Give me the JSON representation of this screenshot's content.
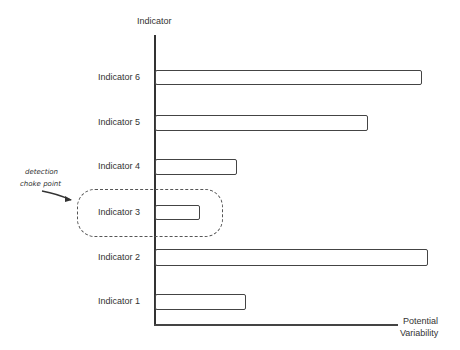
{
  "chart_data": {
    "type": "bar",
    "orientation": "horizontal",
    "style": "hand-drawn sketch",
    "title": "",
    "ylabel": "Indicator",
    "xlabel": "Potential Variability",
    "categories": [
      "Indicator 6",
      "Indicator 5",
      "Indicator 4",
      "Indicator 3",
      "Indicator 2",
      "Indicator 1"
    ],
    "values": [
      267,
      213,
      82,
      45,
      273,
      91
    ],
    "grid": false,
    "legend": null,
    "annotations": [
      {
        "text": "detection choke point",
        "target": "Indicator 3",
        "shape": "dashed rounded rectangle with arrow"
      }
    ]
  },
  "axis": {
    "y_title": "Indicator",
    "x_title_line1": "Potential",
    "x_title_line2": "Variability"
  },
  "annotation": {
    "line1": "detection",
    "line2": "choke point"
  },
  "bars": [
    {
      "label": "Indicator 6",
      "top": 70,
      "height": 15,
      "width": 267
    },
    {
      "label": "Indicator 5",
      "top": 115,
      "height": 16,
      "width": 213
    },
    {
      "label": "Indicator 4",
      "top": 159,
      "height": 16,
      "width": 82
    },
    {
      "label": "Indicator 3",
      "top": 205,
      "height": 15,
      "width": 45
    },
    {
      "label": "Indicator 2",
      "top": 249,
      "height": 17,
      "width": 273
    },
    {
      "label": "Indicator 1",
      "top": 294,
      "height": 16,
      "width": 91
    }
  ]
}
